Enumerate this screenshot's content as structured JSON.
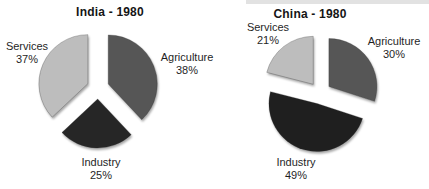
{
  "figure": {
    "background": "#ffffff"
  },
  "chart_data": [
    {
      "type": "pie",
      "title": "India - 1980",
      "direction": "clockwise",
      "start_angle_deg": 0,
      "exploded": true,
      "legend": "none",
      "slices": [
        {
          "label": "Agriculture",
          "value": 38,
          "pct": "38%",
          "color": "#565656"
        },
        {
          "label": "Industry",
          "value": 25,
          "pct": "25%",
          "color": "#262626"
        },
        {
          "label": "Services",
          "value": 37,
          "pct": "37%",
          "color": "#bdbdbd"
        }
      ]
    },
    {
      "type": "pie",
      "title": "China - 1980",
      "direction": "clockwise",
      "start_angle_deg": 0,
      "exploded": true,
      "legend": "none",
      "slices": [
        {
          "label": "Agriculture",
          "value": 30,
          "pct": "30%",
          "color": "#565656"
        },
        {
          "label": "Industry",
          "value": 49,
          "pct": "49%",
          "color": "#1f1f1f"
        },
        {
          "label": "Services",
          "value": 21,
          "pct": "21%",
          "color": "#bdbdbd"
        }
      ]
    }
  ]
}
